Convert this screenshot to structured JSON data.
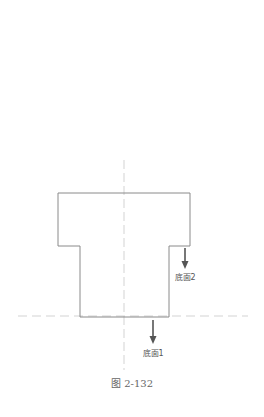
{
  "figure": {
    "caption": "图 2-132",
    "type": "cross-section of stepped part with two bottom faces"
  },
  "labels": {
    "bottom_face_1": "底面1",
    "bottom_face_2": "底面2"
  },
  "colors": {
    "outline": "#8a8a8a",
    "centerline": "#c8c8c8",
    "arrow": "#555555",
    "text": "#555555"
  },
  "geometry": {
    "outline_points": "58,193 190,193 190,246 169,246 169,317 80,317 80,246 58,246",
    "vertical_centerline": {
      "x": 124,
      "y1": 160,
      "y2": 370
    },
    "horizontal_reference_line": {
      "y": 316,
      "x1": 18,
      "x2": 248
    },
    "arrow_2": {
      "x": 185,
      "y1": 248,
      "y2": 268
    },
    "arrow_1": {
      "x": 153,
      "y1": 320,
      "y2": 343
    }
  }
}
